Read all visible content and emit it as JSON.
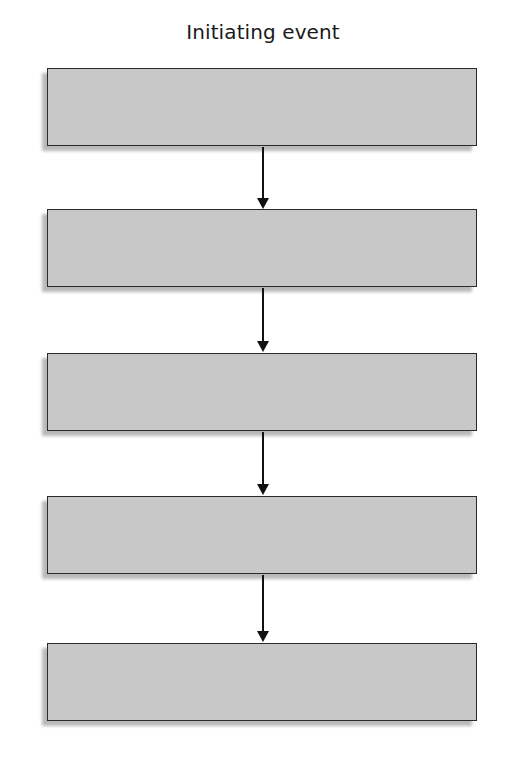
{
  "diagram": {
    "title": "Initiating event",
    "type": "vertical-flowchart",
    "box_fill": "#c8c8c8",
    "border_color": "#2a2a2a",
    "boxes": [
      {
        "index": 1,
        "label": ""
      },
      {
        "index": 2,
        "label": ""
      },
      {
        "index": 3,
        "label": ""
      },
      {
        "index": 4,
        "label": ""
      },
      {
        "index": 5,
        "label": ""
      }
    ],
    "connections": [
      {
        "from": 1,
        "to": 2
      },
      {
        "from": 2,
        "to": 3
      },
      {
        "from": 3,
        "to": 4
      },
      {
        "from": 4,
        "to": 5
      }
    ]
  }
}
